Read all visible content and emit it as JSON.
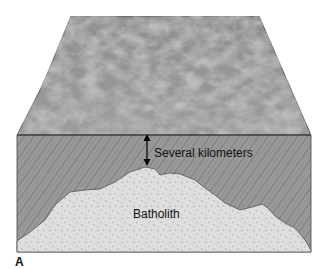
{
  "figure": {
    "panel_label": "A",
    "labels": {
      "distance": "Several kilometers",
      "intrusion": "Batholith"
    },
    "components": [
      {
        "name": "land-surface",
        "description": "rugged topographic surface in perspective"
      },
      {
        "name": "country-rock",
        "description": "metamorphic/host rock with diagonal foliation"
      },
      {
        "name": "batholith",
        "description": "speckled granitic intrusive body"
      }
    ],
    "colors": {
      "surface": "#8a8a8a",
      "country_rock": "#9a9a9a",
      "batholith": "#dcdcdc",
      "outline": "#333333"
    }
  }
}
